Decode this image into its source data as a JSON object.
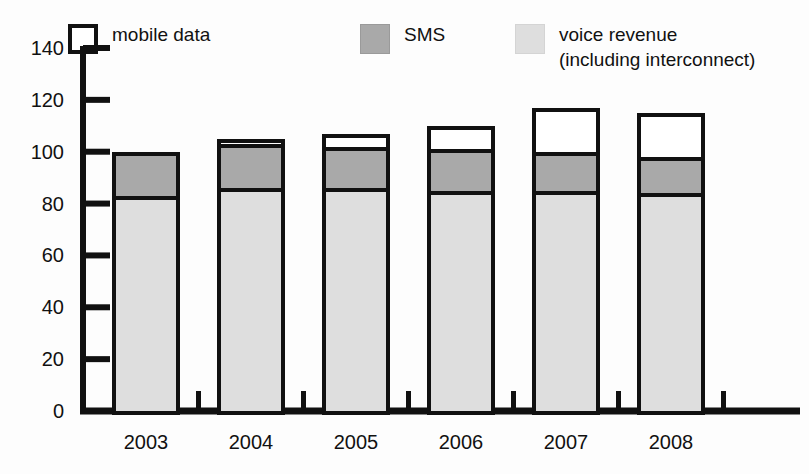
{
  "chart_data": {
    "type": "bar",
    "stacked": true,
    "title": "",
    "subtitle": "",
    "xlabel": "",
    "ylabel": "",
    "categories": [
      "2003",
      "2004",
      "2005",
      "2006",
      "2007",
      "2008"
    ],
    "series": [
      {
        "name": "voice revenue (including interconnect)",
        "color": "#dedede",
        "values": [
          83,
          86,
          86,
          85,
          85,
          84
        ]
      },
      {
        "name": "SMS",
        "color": "#a9a9a9",
        "values": [
          17,
          17,
          16,
          16,
          15,
          14
        ]
      },
      {
        "name": "mobile data",
        "color": "#ffffff",
        "values": [
          0,
          2,
          5,
          9,
          17,
          17
        ]
      }
    ],
    "totals": [
      100,
      105,
      107,
      110,
      117,
      115
    ],
    "ylim": [
      0,
      140
    ],
    "yticks": [
      0,
      20,
      40,
      60,
      80,
      100,
      120,
      140
    ],
    "ytick_labels": [
      "0",
      "20",
      "40",
      "60",
      "80",
      "100",
      "120",
      "140"
    ],
    "grid": false,
    "legend_position": "top"
  },
  "legend": {
    "entries": [
      {
        "key": "mobile",
        "label": "mobile data",
        "label_line2": "",
        "swatch": "white-square-swatch"
      },
      {
        "key": "sms",
        "label": "SMS",
        "label_line2": "",
        "swatch": "gray-square-swatch"
      },
      {
        "key": "voice",
        "label": "voice revenue",
        "label_line2": "(including interconnect)",
        "swatch": "light-gray-square-swatch"
      }
    ]
  },
  "colors": {
    "axis": "#111111",
    "mobile_data": "#ffffff",
    "sms": "#a9a9a9",
    "voice": "#dedede",
    "background": "#fdfdfd"
  }
}
